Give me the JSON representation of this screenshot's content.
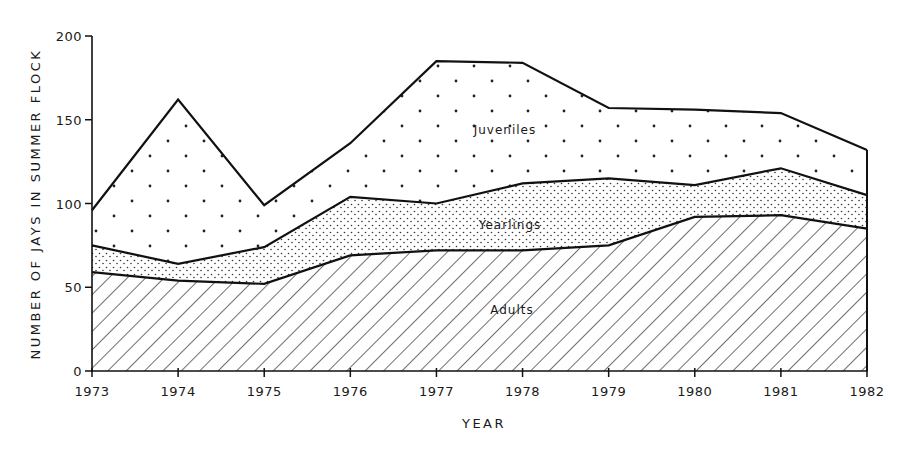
{
  "chart_data": {
    "type": "area",
    "stacked": true,
    "title": "",
    "xlabel": "YEAR",
    "ylabel": "NUMBER OF JAYS IN SUMMER FLOCK",
    "ylim": [
      0,
      200
    ],
    "yticks": [
      0,
      50,
      100,
      150,
      200
    ],
    "categories": [
      "1973",
      "1974",
      "1975",
      "1976",
      "1977",
      "1978",
      "1979",
      "1980",
      "1981",
      "1982"
    ],
    "grid": false,
    "legend": "inline labels",
    "series": [
      {
        "name": "Adults",
        "pattern": "diagonal-hatch",
        "values": [
          59,
          54,
          52,
          69,
          72,
          72,
          75,
          92,
          93,
          85
        ]
      },
      {
        "name": "Yearlings",
        "pattern": "fine-stipple",
        "values": [
          16,
          10,
          22,
          35,
          28,
          40,
          40,
          19,
          28,
          20
        ]
      },
      {
        "name": "Juveniles",
        "pattern": "sparse-dots",
        "values": [
          21,
          98,
          25,
          32,
          85,
          72,
          42,
          45,
          33,
          27
        ]
      }
    ],
    "cumulative_tops": {
      "Adults": [
        59,
        54,
        52,
        69,
        72,
        72,
        75,
        92,
        93,
        85
      ],
      "Adults+Yearlings": [
        75,
        64,
        74,
        104,
        100,
        112,
        115,
        111,
        121,
        105
      ],
      "Total": [
        96,
        162,
        99,
        136,
        185,
        184,
        157,
        156,
        154,
        132
      ]
    },
    "annotations": [
      {
        "text": "Juveniles",
        "x": "1978.5",
        "y": 145
      },
      {
        "text": "Yearlings",
        "x": "1978",
        "y": 88
      },
      {
        "text": "Adults",
        "x": "1978",
        "y": 36
      }
    ]
  },
  "axes": {
    "x_title": "YEAR",
    "y_title": "NUMBER OF JAYS IN SUMMER FLOCK",
    "y_tick_labels": [
      "0",
      "50",
      "100",
      "150",
      "200"
    ],
    "x_tick_labels": [
      "1973",
      "1974",
      "1975",
      "1976",
      "1977",
      "1978",
      "1979",
      "1980",
      "1981",
      "1982"
    ]
  },
  "labels": {
    "juveniles": "Juveniles",
    "yearlings": "Yearlings",
    "adults": "Adults"
  }
}
